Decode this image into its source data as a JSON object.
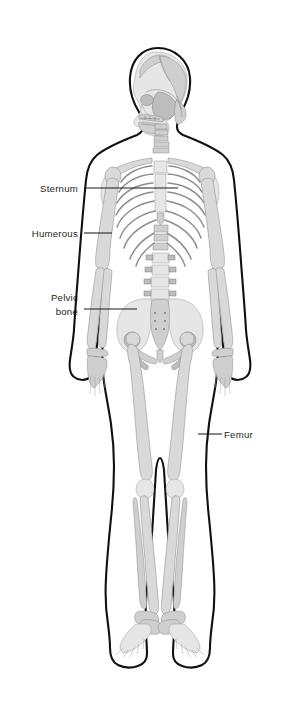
{
  "document": {
    "title": "Human Skeleton Anatomy Diagram",
    "view": "Anterior full-body skeletal illustration inside body outline",
    "background_color": "#ffffff",
    "outline_color": "#111111",
    "bone_fill_color": "#d9d9d9",
    "label_color": "#231f20"
  },
  "figure": {
    "orientation": "front-facing body with head shown in left profile",
    "regions": [
      "skull",
      "cervical-spine",
      "clavicle",
      "scapula",
      "sternum",
      "ribcage",
      "humerus",
      "radius-ulna",
      "hand",
      "lumbar-spine",
      "pelvis",
      "sacrum",
      "femur",
      "patella",
      "tibia-fibula",
      "foot"
    ]
  },
  "labels": [
    {
      "id": "sternum",
      "text": "Sternum",
      "lines": [
        "Sternum"
      ],
      "side": "left",
      "text_x": 78,
      "text_y": 192,
      "leader_from_x": 84,
      "leader_from_y": 188,
      "leader_to_x": 178,
      "leader_to_y": 188
    },
    {
      "id": "humerous",
      "text": "Humerous",
      "lines": [
        "Humerous"
      ],
      "side": "left",
      "text_x": 78,
      "text_y": 237,
      "leader_from_x": 84,
      "leader_from_y": 233,
      "leader_to_x": 112,
      "leader_to_y": 233
    },
    {
      "id": "pelvic-bone",
      "text": "Pelvic bone",
      "lines": [
        "Pelvic",
        "bone"
      ],
      "side": "left",
      "text_x": 78,
      "text_y": 301,
      "text_y2": 315,
      "leader_from_x": 84,
      "leader_from_y": 309,
      "leader_to_x": 137,
      "leader_to_y": 309
    },
    {
      "id": "femur",
      "text": "Femur",
      "lines": [
        "Femur"
      ],
      "side": "right",
      "text_x": 224,
      "text_y": 438,
      "leader_from_x": 198,
      "leader_from_y": 434,
      "leader_to_x": 222,
      "leader_to_y": 434
    }
  ]
}
